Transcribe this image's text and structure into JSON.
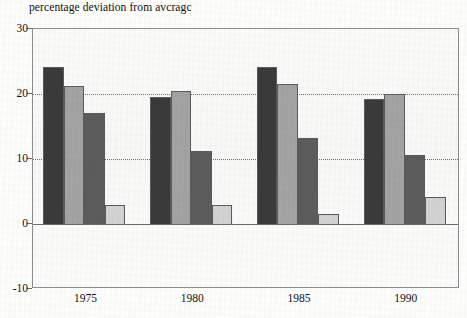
{
  "chart_data": {
    "type": "bar",
    "title": "percentage deviation from avcragc",
    "xlabel": "",
    "ylabel": "",
    "categories": [
      "1975",
      "1980",
      "1985",
      "1990"
    ],
    "series": [
      {
        "name": "series-1",
        "color": "#3a3a3a",
        "values": [
          24.1,
          19.5,
          24.2,
          19.2
        ]
      },
      {
        "name": "series-2",
        "color": "#a3a3a3",
        "values": [
          21.2,
          20.5,
          21.6,
          20.0
        ]
      },
      {
        "name": "series-3",
        "color": "#5c5c5c",
        "values": [
          17.1,
          11.3,
          13.3,
          10.6
        ]
      },
      {
        "name": "series-4",
        "color": "#d2d2d2",
        "values": [
          3.0,
          3.0,
          1.6,
          4.2
        ]
      }
    ],
    "ylim": [
      -10,
      30
    ],
    "yticks": [
      30,
      20,
      10,
      0,
      -10
    ],
    "ytick_labels": [
      "30",
      "20",
      "10",
      "0",
      "-10"
    ],
    "gridlines": [
      20,
      10
    ],
    "grid": true,
    "legend": "none",
    "zero_line": 0,
    "axis_color": "#6a6a6a",
    "grid_color": "#6f6f6f",
    "bar_edge_color": "#5a5a5a",
    "plot_background": "#faf9f8"
  }
}
